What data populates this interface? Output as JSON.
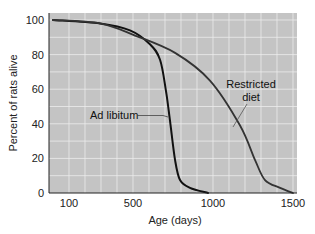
{
  "chart_data": {
    "type": "line",
    "title": "",
    "xlabel": "Age (days)",
    "ylabel": "Percent of rats alive",
    "xlim": [
      0,
      1500
    ],
    "ylim": [
      0,
      100
    ],
    "x_ticks": [
      100,
      500,
      1000,
      1500
    ],
    "y_ticks": [
      0,
      20,
      40,
      60,
      80,
      100
    ],
    "grid": true,
    "grid_x_step": 100,
    "grid_y_step": 10,
    "legend_position": "inline annotations",
    "series": [
      {
        "name": "Ad libitum",
        "color": "#111111",
        "x": [
          0,
          294,
          481,
          606,
          669,
          706,
          731,
          763,
          794,
          856,
          969
        ],
        "y": [
          100,
          98,
          94,
          86,
          77,
          59,
          42,
          19,
          7.5,
          3,
          0
        ]
      },
      {
        "name": "Restricted diet",
        "color": "#333333",
        "x": [
          0,
          294,
          513,
          763,
          981,
          1169,
          1263,
          1325,
          1419,
          1500
        ],
        "y": [
          100,
          98,
          91,
          81,
          65,
          39,
          19,
          7.5,
          3,
          0
        ]
      }
    ],
    "annotations": [
      {
        "text": "Ad libitum",
        "series": "Ad libitum"
      },
      {
        "text_lines": [
          "Restricted",
          "diet"
        ],
        "series": "Restricted diet"
      }
    ]
  },
  "colors": {
    "plot_background": "#c4c4c4",
    "grid": "#ececec",
    "line": "#111111",
    "axis": "#222222"
  },
  "labels": {
    "ad_libitum": "Ad libitum",
    "restricted_line1": "Restricted",
    "restricted_line2": "diet",
    "xlabel": "Age (days)",
    "ylabel": "Percent of rats alive"
  }
}
